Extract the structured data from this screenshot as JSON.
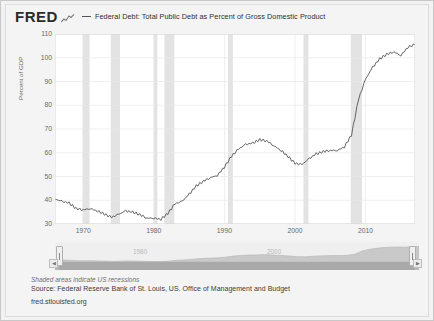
{
  "brand": {
    "logo_text": "FRED",
    "logo_mark_icon": "squiggle-chart-icon"
  },
  "legend": {
    "marker_icon": "line-dash-icon",
    "label": "Federal Debt: Total Public Debt as Percent of Gross Domestic Product"
  },
  "footer": {
    "shaded_note": "Shaded areas indicate US recessions",
    "source": "Source: Federal Reserve Bank of St. Louis, US. Office of Management and Budget",
    "url": "fred.stlouisfed.org"
  },
  "navigator": {
    "left_handle_icon": "drag-handle-icon",
    "right_handle_icon": "drag-handle-icon",
    "left_arrow_icon": "chevron-left-icon",
    "right_arrow_icon": "chevron-right-icon",
    "labels": [
      "1980",
      "2000"
    ],
    "label_positions": [
      120,
      250
    ]
  },
  "colors": {
    "line": "#555555",
    "recession_band": "#e3e3e3",
    "grid": "#e8e8e8",
    "plot_bg": "#ffffff",
    "page_bg": "#f4f4f4",
    "nav_area": "#cfcfcf",
    "axis_text": "#6a6a6a"
  },
  "chart_data": {
    "type": "line",
    "title": "Federal Debt: Total Public Debt as Percent of Gross Domestic Product",
    "xlabel": "",
    "ylabel": "Percent of GDP",
    "ylim": [
      30,
      110
    ],
    "xlim": [
      1966,
      2017
    ],
    "ytick_values": [
      30,
      40,
      50,
      60,
      70,
      80,
      90,
      100,
      110
    ],
    "xtick_values": [
      1970,
      1980,
      1990,
      2000,
      2010
    ],
    "grid": true,
    "legend_position": "top",
    "series": [
      {
        "name": "Federal Debt: Total Public Debt as Percent of Gross Domestic Product",
        "color": "#555555",
        "x": [
          1966,
          1967,
          1968,
          1969,
          1970,
          1971,
          1972,
          1973,
          1974,
          1975,
          1976,
          1977,
          1978,
          1979,
          1980,
          1981,
          1982,
          1983,
          1984,
          1985,
          1986,
          1987,
          1988,
          1989,
          1990,
          1991,
          1992,
          1993,
          1994,
          1995,
          1996,
          1997,
          1998,
          1999,
          2000,
          2001,
          2002,
          2003,
          2004,
          2005,
          2006,
          2007,
          2008,
          2009,
          2010,
          2011,
          2012,
          2013,
          2014,
          2015,
          2016,
          2017
        ],
        "values": [
          40.5,
          39.5,
          38.8,
          36.5,
          36.0,
          36.5,
          35.5,
          34.2,
          32.8,
          34.0,
          35.5,
          35.0,
          34.0,
          32.5,
          32.5,
          32.0,
          34.5,
          38.5,
          39.5,
          42.5,
          46.0,
          48.0,
          49.5,
          50.5,
          54.0,
          58.5,
          61.5,
          63.5,
          64.0,
          65.5,
          65.0,
          63.0,
          61.0,
          58.5,
          55.5,
          55.0,
          57.5,
          59.5,
          60.5,
          61.0,
          61.0,
          62.5,
          67.5,
          82.5,
          91.0,
          96.0,
          99.5,
          101.5,
          102.5,
          101.0,
          104.5,
          105.5
        ]
      }
    ],
    "recession_bands": [
      {
        "start": 1969.9,
        "end": 1970.9
      },
      {
        "start": 1973.9,
        "end": 1975.2
      },
      {
        "start": 1980.0,
        "end": 1980.5
      },
      {
        "start": 1981.5,
        "end": 1982.9
      },
      {
        "start": 1990.5,
        "end": 1991.2
      },
      {
        "start": 2001.2,
        "end": 2001.9
      },
      {
        "start": 2007.9,
        "end": 2009.5
      }
    ]
  }
}
